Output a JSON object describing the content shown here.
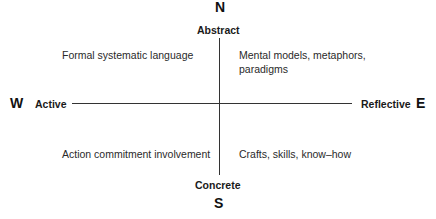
{
  "diagram": {
    "compass": {
      "north": "N",
      "south": "S",
      "west": "W",
      "east": "E"
    },
    "poles": {
      "top": "Abstract",
      "bottom": "Concrete",
      "left": "Active",
      "right": "Reflective"
    },
    "quadrants": {
      "top_left": [
        "Formal systematic language"
      ],
      "top_right": [
        "Mental models, metaphors,",
        "paradigms"
      ],
      "bottom_left": [
        "Action commitment involvement"
      ],
      "bottom_right": [
        "Crafts, skills, know–how"
      ]
    },
    "colors": {
      "axis": "#333333",
      "text": "#1a1a1a",
      "background": "#ffffff"
    }
  }
}
